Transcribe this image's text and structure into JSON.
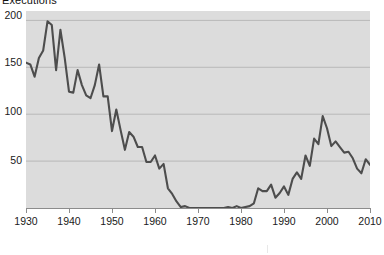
{
  "chart_data": {
    "type": "line",
    "title": "Executions",
    "xlabel": "",
    "ylabel": "",
    "xlim": [
      1930,
      2010
    ],
    "ylim": [
      0,
      210
    ],
    "grid": true,
    "legend": false,
    "line_color": "#4d4d4d",
    "plot_background": "#dcdcdc",
    "gridline_color": "#b8b8b8",
    "x_ticks": [
      1930,
      1940,
      1950,
      1960,
      1970,
      1980,
      1990,
      2000,
      2010
    ],
    "y_ticks": [
      50,
      100,
      150,
      200
    ],
    "series": [
      {
        "name": "Executions",
        "x": [
          1930,
          1931,
          1932,
          1933,
          1934,
          1935,
          1936,
          1937,
          1938,
          1939,
          1940,
          1941,
          1942,
          1943,
          1944,
          1945,
          1946,
          1947,
          1948,
          1949,
          1950,
          1951,
          1952,
          1953,
          1954,
          1955,
          1956,
          1957,
          1958,
          1959,
          1960,
          1961,
          1962,
          1963,
          1964,
          1965,
          1966,
          1967,
          1968,
          1969,
          1970,
          1971,
          1972,
          1973,
          1974,
          1975,
          1976,
          1977,
          1978,
          1979,
          1980,
          1981,
          1982,
          1983,
          1984,
          1985,
          1986,
          1987,
          1988,
          1989,
          1990,
          1991,
          1992,
          1993,
          1994,
          1995,
          1996,
          1997,
          1998,
          1999,
          2000,
          2001,
          2002,
          2003,
          2004,
          2005,
          2006,
          2007,
          2008,
          2009,
          2010
        ],
        "values": [
          155,
          153,
          140,
          160,
          168,
          199,
          195,
          147,
          190,
          160,
          124,
          123,
          147,
          131,
          120,
          117,
          131,
          153,
          119,
          119,
          82,
          105,
          83,
          62,
          81,
          76,
          65,
          65,
          49,
          49,
          56,
          42,
          47,
          21,
          15,
          7,
          1,
          2,
          0,
          0,
          0,
          0,
          0,
          0,
          0,
          0,
          0,
          1,
          0,
          2,
          0,
          1,
          2,
          5,
          21,
          18,
          18,
          25,
          11,
          16,
          23,
          14,
          31,
          38,
          31,
          56,
          45,
          74,
          68,
          98,
          85,
          66,
          71,
          65,
          59,
          60,
          53,
          42,
          37,
          52,
          46
        ]
      }
    ]
  },
  "axis": {
    "y_tick_labels": [
      "200",
      "150",
      "100",
      "50"
    ],
    "x_tick_labels": [
      "1930",
      "1940",
      "1950",
      "1960",
      "1970",
      "1980",
      "1990",
      "2000",
      "2010"
    ]
  },
  "caption": {
    "fragment": "",
    "visible": false
  }
}
